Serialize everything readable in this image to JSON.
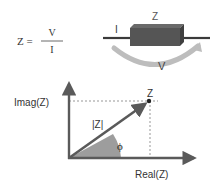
{
  "formula": {
    "lhs": "Z =",
    "numerator": "V",
    "denominator": "I"
  },
  "component": {
    "label_impedance": "Z",
    "label_current": "I",
    "label_voltage": "V"
  },
  "phasor": {
    "y_axis_label": "Imag(Z)",
    "x_axis_label": "Real(Z)",
    "point_label": "Z",
    "magnitude_label": "|Z|",
    "angle_label": "ϕ"
  },
  "colors": {
    "axis": "#5a5a5a",
    "box": "#555555",
    "box_top": "#6a6a6a",
    "box_side": "#3f3f3f",
    "arc": "#b9b9b9",
    "angle_fill": "#8c8c8c",
    "dashed": "#6a6a6a"
  }
}
